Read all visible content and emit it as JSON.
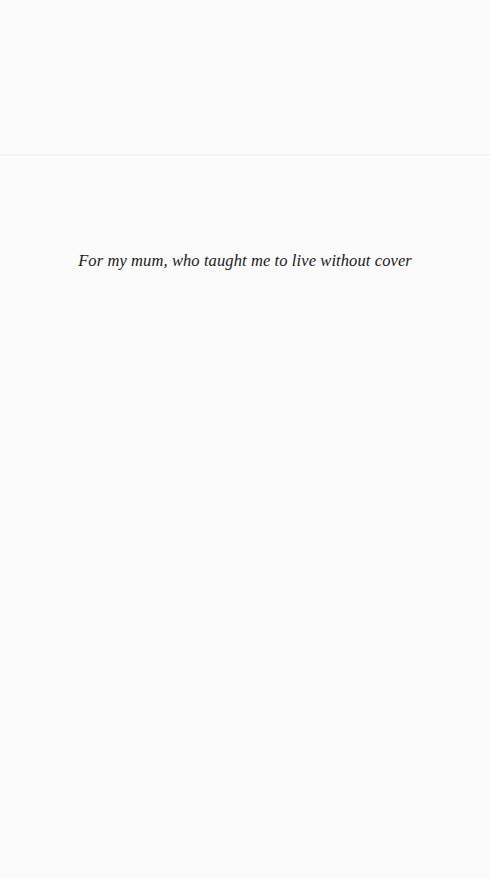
{
  "page": {
    "dedication": "For my mum, who taught me to live without cover"
  }
}
